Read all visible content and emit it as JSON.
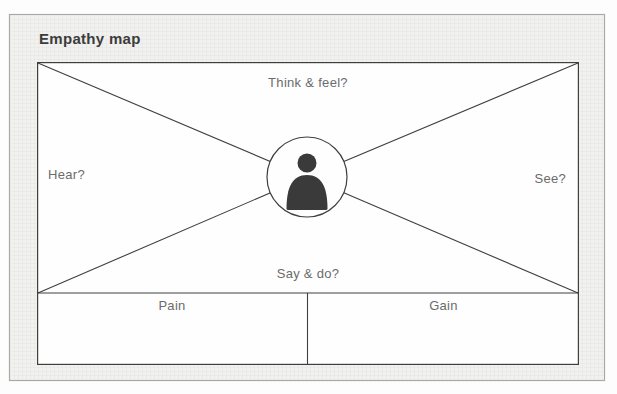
{
  "title": "Empathy map",
  "diagram": {
    "sections": {
      "think_feel": "Think & feel?",
      "hear": "Hear?",
      "see": "See?",
      "say_do": "Say & do?",
      "pain": "Pain",
      "gain": "Gain"
    },
    "center_icon": "person-icon",
    "colors": {
      "line": "#3f3f3f",
      "label_text": "#6b6b6b",
      "title_text": "#3c3c3c",
      "card_bg": "#f1f1ef",
      "card_border": "#a8a8a6",
      "panel_bg": "#fefefe",
      "icon_fill": "#3a3a3a"
    }
  }
}
